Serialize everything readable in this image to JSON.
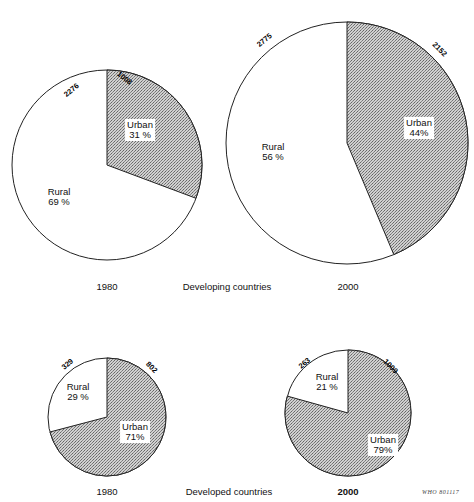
{
  "figure": {
    "section_top": {
      "label_left_year": "1980",
      "group_label": "Developing countries",
      "label_right_year": "2000"
    },
    "section_bottom": {
      "label_left_year": "1980",
      "group_label": "Developed countries",
      "label_right_year": "2000"
    },
    "source_code": "WHO 801117",
    "colors": {
      "urban_fill": "#b4b4b4",
      "rural_fill": "#ffffff",
      "outline": "#222222"
    }
  },
  "chart_data": [
    {
      "type": "pie",
      "title": "Developing countries 1980",
      "group": "Developing countries",
      "year": "1980",
      "labels": [
        "Urban",
        "Rural"
      ],
      "values": [
        1008,
        2276
      ],
      "percent_labels": [
        "31 %",
        "69 %"
      ],
      "center": [
        107,
        165
      ],
      "radius": 95
    },
    {
      "type": "pie",
      "title": "Developing countries 2000",
      "group": "Developing countries",
      "year": "2000",
      "labels": [
        "Urban",
        "Rural"
      ],
      "values": [
        2152,
        2775
      ],
      "percent_labels": [
        "44%",
        "56 %"
      ],
      "center": [
        347,
        143
      ],
      "radius": 121
    },
    {
      "type": "pie",
      "title": "Developed countries 1980",
      "group": "Developed countries",
      "year": "1980",
      "labels": [
        "Urban",
        "Rural"
      ],
      "values": [
        802,
        329
      ],
      "percent_labels": [
        "71%",
        "29 %"
      ],
      "center": [
        107,
        417
      ],
      "radius": 59
    },
    {
      "type": "pie",
      "title": "Developed countries 2000",
      "group": "Developed countries",
      "year": "2000",
      "labels": [
        "Urban",
        "Rural"
      ],
      "values": [
        1009,
        263
      ],
      "percent_labels": [
        "79%",
        "21 %"
      ],
      "center": [
        348,
        413
      ],
      "radius": 63
    }
  ],
  "label_positions": [
    {
      "urban": [
        140,
        130
      ],
      "rural": [
        59,
        197
      ],
      "urban_val": [
        123,
        80
      ],
      "rural_val": [
        73,
        92
      ]
    },
    {
      "urban": [
        419,
        128
      ],
      "rural": [
        273,
        152
      ],
      "urban_val": [
        438,
        51
      ],
      "rural_val": [
        266,
        42
      ]
    },
    {
      "urban": [
        135,
        432
      ],
      "rural": [
        78,
        392
      ],
      "urban_val": [
        150,
        369
      ],
      "rural_val": [
        69,
        366
      ]
    },
    {
      "urban": [
        383,
        445
      ],
      "rural": [
        327,
        382
      ],
      "urban_val": [
        389,
        368
      ],
      "rural_val": [
        306,
        365
      ]
    }
  ]
}
